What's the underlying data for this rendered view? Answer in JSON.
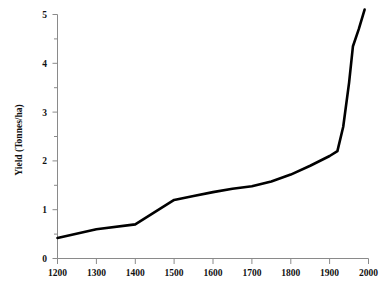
{
  "chart_data": {
    "type": "line",
    "title": "",
    "xlabel": "",
    "ylabel": "Yield (Tonnes/ha)",
    "xlim": [
      1200,
      2000
    ],
    "ylim": [
      0,
      5
    ],
    "grid": false,
    "legend": false,
    "legend_position": "none",
    "line_color": "#000000",
    "axis_color": "#8a8a8a",
    "background_color": "#ffffff",
    "x_ticks": [
      1200,
      1300,
      1400,
      1500,
      1600,
      1700,
      1800,
      1900,
      2000
    ],
    "x_tick_labels": [
      "1200",
      "1300",
      "1400",
      "1500",
      "1600",
      "1700",
      "1800",
      "1900",
      "2000"
    ],
    "y_ticks": [
      0,
      1,
      2,
      3,
      4,
      5
    ],
    "y_tick_labels": [
      "0",
      "1",
      "2",
      "3",
      "4",
      "5"
    ],
    "y_minor_ticks": [
      0.5,
      1.5,
      2.5,
      3.5,
      4.5
    ],
    "series": [
      {
        "name": "Yield",
        "x": [
          1200,
          1300,
          1400,
          1450,
          1500,
          1550,
          1600,
          1650,
          1700,
          1750,
          1800,
          1850,
          1900,
          1920,
          1935,
          1950,
          1960,
          1975,
          1990
        ],
        "values": [
          0.42,
          0.6,
          0.7,
          0.95,
          1.2,
          1.28,
          1.36,
          1.43,
          1.48,
          1.58,
          1.72,
          1.9,
          2.1,
          2.2,
          2.7,
          3.6,
          4.35,
          4.7,
          5.1
        ]
      }
    ]
  }
}
